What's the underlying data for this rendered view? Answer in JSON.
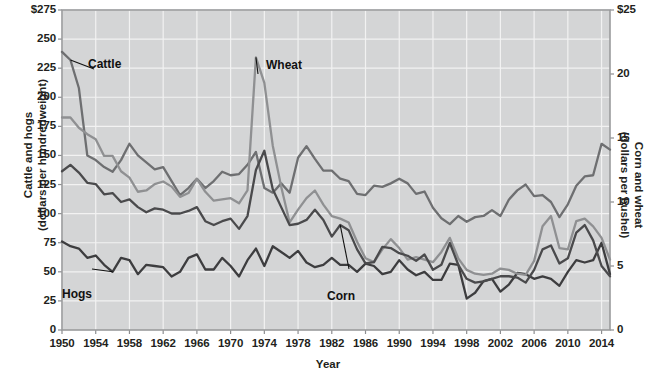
{
  "chart_data": {
    "type": "line",
    "title": "",
    "xlabel": "Year",
    "ylabel": "Cattle and hogs (dollars per hundredweight)",
    "y2label": "Corn and wheat (dollars per bushel)",
    "ylabel_line1": "Cattle and hogs",
    "ylabel_line2": "(dollars per hundredweight)",
    "y2label_line1": "Corn and wheat",
    "y2label_line2": "(dollars per bushel)",
    "grid": true,
    "legend_position": "inline-annotations",
    "xlim": [
      1950,
      2015
    ],
    "ylim": [
      0,
      275
    ],
    "y2lim": [
      0,
      25
    ],
    "x_ticks": [
      1950,
      1954,
      1958,
      1962,
      1966,
      1970,
      1974,
      1978,
      1982,
      1986,
      1990,
      1994,
      1998,
      2002,
      2006,
      2010,
      2014
    ],
    "x_tick_labels": [
      "1950",
      "1954",
      "1958",
      "1962",
      "1966",
      "1970",
      "1974",
      "1978",
      "1982",
      "1986",
      "1990",
      "1994",
      "1998",
      "2002",
      "2006",
      "2010",
      "2014"
    ],
    "y_ticks": [
      0,
      25,
      50,
      75,
      100,
      125,
      150,
      175,
      200,
      225,
      250,
      275
    ],
    "y_tick_labels": [
      "0",
      "25",
      "50",
      "75",
      "100",
      "125",
      "150",
      "175",
      "200",
      "225",
      "250",
      "$275"
    ],
    "y2_ticks": [
      0,
      5,
      10,
      15,
      20,
      25
    ],
    "y2_tick_labels": [
      "0",
      "5",
      "10",
      "15",
      "20",
      "$25"
    ],
    "x": [
      1950,
      1951,
      1952,
      1953,
      1954,
      1955,
      1956,
      1957,
      1958,
      1959,
      1960,
      1961,
      1962,
      1963,
      1964,
      1965,
      1966,
      1967,
      1968,
      1969,
      1970,
      1971,
      1972,
      1973,
      1974,
      1975,
      1976,
      1977,
      1978,
      1979,
      1980,
      1981,
      1982,
      1983,
      1984,
      1985,
      1986,
      1987,
      1988,
      1989,
      1990,
      1991,
      1992,
      1993,
      1994,
      1995,
      1996,
      1997,
      1998,
      1999,
      2000,
      2001,
      2002,
      2003,
      2004,
      2005,
      2006,
      2007,
      2008,
      2009,
      2010,
      2011,
      2012,
      2013,
      2014,
      2015
    ],
    "series": [
      {
        "name": "Cattle",
        "axis": "left",
        "units": "dollars per hundredweight",
        "color": "#6e6f71",
        "label_anchor_year": 1951,
        "values": [
          239,
          232,
          208,
          150,
          146,
          140,
          136,
          146,
          160,
          150,
          144,
          138,
          140,
          128,
          116,
          122,
          130,
          122,
          128,
          136,
          133,
          134,
          142,
          153,
          122,
          118,
          126,
          118,
          148,
          158,
          147,
          137,
          137,
          130,
          128,
          117,
          116,
          124,
          123,
          126,
          130,
          126,
          117,
          119,
          105,
          96,
          91,
          98,
          93,
          97,
          98,
          103,
          98,
          112,
          120,
          125,
          115,
          116,
          110,
          97,
          108,
          124,
          132,
          133,
          160,
          155
        ]
      },
      {
        "name": "Hogs",
        "axis": "left",
        "units": "dollars per hundredweight",
        "color": "#3d3d3f",
        "label_anchor_year": 1954,
        "values": [
          76,
          72,
          70,
          62,
          64,
          56,
          50,
          62,
          60,
          48,
          56,
          55,
          54,
          46,
          50,
          62,
          65,
          52,
          52,
          62,
          55,
          46,
          60,
          70,
          55,
          72,
          67,
          62,
          68,
          58,
          54,
          56,
          62,
          56,
          56,
          50,
          57,
          55,
          48,
          50,
          60,
          52,
          47,
          50,
          43,
          43,
          57,
          56,
          27,
          32,
          42,
          44,
          33,
          39,
          49,
          48,
          44,
          46,
          44,
          38,
          50,
          60,
          58,
          60,
          75,
          48
        ]
      },
      {
        "name": "Wheat",
        "axis": "right",
        "units": "dollars per bushel",
        "color": "#8f9092",
        "label_anchor_year": 1974,
        "values": [
          16.6,
          16.6,
          15.8,
          15.3,
          14.9,
          13.6,
          13.6,
          12.4,
          11.9,
          10.8,
          10.9,
          11.4,
          11.6,
          11.2,
          10.4,
          10.7,
          11.8,
          10.8,
          10.1,
          10.2,
          10.3,
          9.9,
          10.9,
          21.3,
          19.3,
          14.4,
          11.2,
          8.4,
          9.4,
          10.3,
          10.9,
          9.8,
          8.9,
          8.7,
          8.4,
          6.9,
          5.6,
          5.3,
          6.3,
          7.1,
          6.4,
          5.5,
          5.7,
          5.5,
          5.3,
          6.1,
          7.2,
          5.6,
          4.7,
          4.4,
          4.3,
          4.4,
          4.8,
          4.7,
          4.4,
          4.3,
          5.4,
          8.1,
          8.9,
          6.4,
          6.3,
          8.5,
          8.7,
          8.1,
          7.2,
          5.5
        ]
      },
      {
        "name": "Corn",
        "axis": "right",
        "units": "dollars per bushel",
        "color": "#4a4a4c",
        "label_anchor_year": 1984,
        "values": [
          12.4,
          12.9,
          12.3,
          11.5,
          11.4,
          10.6,
          10.7,
          10.0,
          10.2,
          9.6,
          9.2,
          9.5,
          9.4,
          9.1,
          9.1,
          9.3,
          9.6,
          8.5,
          8.2,
          8.5,
          8.7,
          7.9,
          8.9,
          12.5,
          14.0,
          11.0,
          9.6,
          8.2,
          8.3,
          8.6,
          9.4,
          8.6,
          7.3,
          8.2,
          7.8,
          6.3,
          5.2,
          5.3,
          6.5,
          6.4,
          6.0,
          5.8,
          5.4,
          5.9,
          4.7,
          5.1,
          6.8,
          5.1,
          4.0,
          3.7,
          3.8,
          4.0,
          4.2,
          4.2,
          4.1,
          3.7,
          4.7,
          6.3,
          6.6,
          5.2,
          5.6,
          7.6,
          8.2,
          7.0,
          5.0,
          4.2
        ]
      }
    ],
    "annotations": [
      {
        "text": "Cattle",
        "series": "Cattle"
      },
      {
        "text": "Hogs",
        "series": "Hogs"
      },
      {
        "text": "Wheat",
        "series": "Wheat"
      },
      {
        "text": "Corn",
        "series": "Corn"
      }
    ]
  },
  "colors": {
    "plot_background": "#d4d5d6",
    "gridline": "#f2f2f2",
    "frame": "#9a9b9d",
    "text": "#231f20",
    "cattle": "#6e6f71",
    "hogs": "#3d3d3f",
    "wheat": "#8f9092",
    "corn": "#4a4a4c"
  }
}
